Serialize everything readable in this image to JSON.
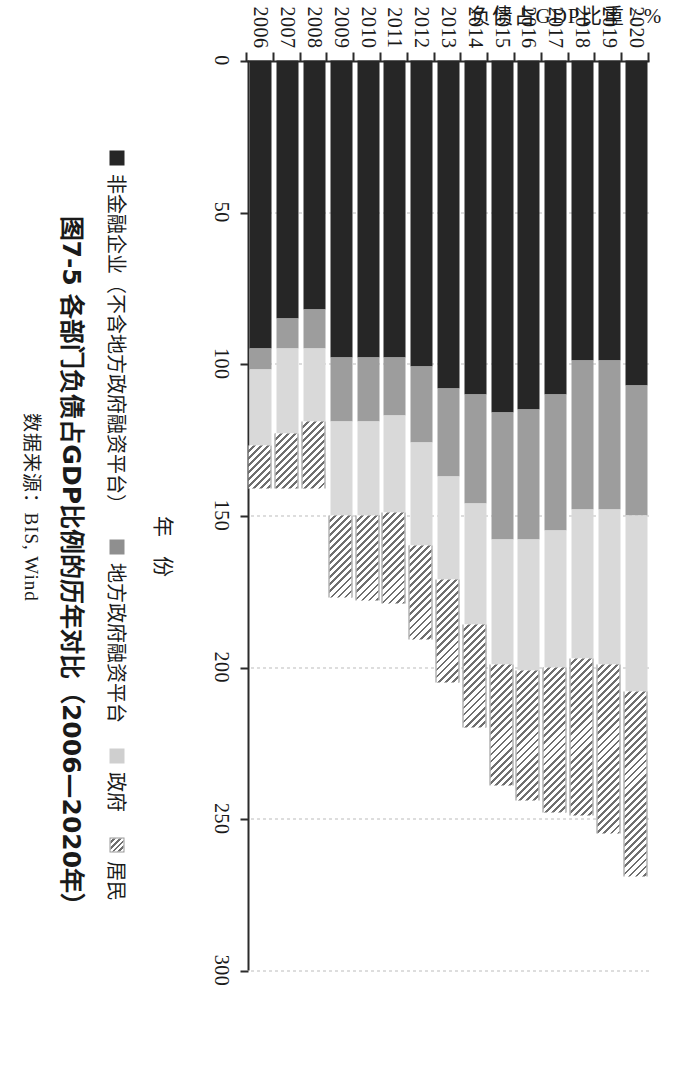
{
  "figure": {
    "caption": "图7-5  各部门负债占GDP比例的历年对比（2006—2020年）",
    "source": "数据来源：BIS, Wind",
    "x_axis_title": "年 份",
    "y_axis_title": "负债占GDP比重 / %"
  },
  "legend": {
    "items": [
      {
        "label": "非金融企业（不含地方政府融资平台）",
        "swatch": "dark-solid-swatch",
        "color": "#262626"
      },
      {
        "label": "地方政府融资平台",
        "swatch": "gray-solid-swatch",
        "color": "#8f8f8f"
      },
      {
        "label": "政府",
        "swatch": "light-gray-solid-swatch",
        "color": "#cfcfcf"
      },
      {
        "label": "居民",
        "swatch": "hatched-swatch",
        "color": "#6f6f6f"
      }
    ]
  },
  "chart_data": {
    "type": "bar",
    "orientation": "horizontal-stacked",
    "title": "图7-5  各部门负债占GDP比例的历年对比（2006—2020年）",
    "xlabel": "年 份",
    "ylabel": "负债占GDP比重 / %",
    "ylim": [
      0,
      300
    ],
    "yticks": [
      0,
      50,
      100,
      150,
      200,
      250,
      300
    ],
    "ytick_labels": [
      "0",
      "50",
      "100",
      "150",
      "200",
      "250",
      "300"
    ],
    "grid": true,
    "legend_position": "below-axis",
    "categories": [
      "2006",
      "2007",
      "2008",
      "2009",
      "2010",
      "2011",
      "2012",
      "2013",
      "2014",
      "2015",
      "2016",
      "2017",
      "2018",
      "2019",
      "2020"
    ],
    "series": [
      {
        "name": "非金融企业（不含地方政府融资平台）",
        "values": [
          95,
          85,
          82,
          98,
          98,
          98,
          101,
          108,
          110,
          116,
          115,
          110,
          99,
          99,
          107
        ]
      },
      {
        "name": "地方政府融资平台",
        "values": [
          7,
          10,
          13,
          21,
          21,
          19,
          25,
          29,
          36,
          42,
          43,
          45,
          49,
          49,
          43
        ]
      },
      {
        "name": "政府",
        "values": [
          25,
          28,
          24,
          31,
          31,
          32,
          34,
          34,
          40,
          41,
          43,
          45,
          49,
          51,
          58
        ]
      },
      {
        "name": "居民",
        "values": [
          14,
          18,
          22,
          27,
          28,
          30,
          31,
          34,
          34,
          40,
          43,
          48,
          52,
          56,
          61
        ]
      }
    ],
    "totals": [
      141,
      141,
      141,
      177,
      178,
      179,
      191,
      205,
      220,
      239,
      244,
      248,
      249,
      255,
      269
    ]
  }
}
